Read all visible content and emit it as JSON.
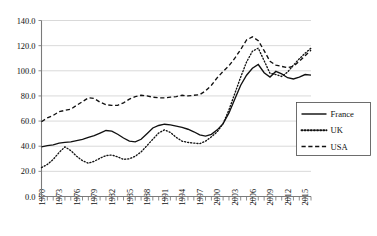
{
  "chart_data": {
    "type": "line",
    "title": "",
    "subtitle": "",
    "xlabel": "",
    "ylabel": "",
    "ylim": [
      0.0,
      140.0
    ],
    "xlim": [
      1970,
      2016
    ],
    "yticks": [
      "0.0",
      "20.0",
      "40.0",
      "60.0",
      "80.0",
      "100.0",
      "120.0",
      "140.0"
    ],
    "ytick_values": [
      0.0,
      20.0,
      40.0,
      60.0,
      80.0,
      100.0,
      120.0,
      140.0
    ],
    "xticks": [
      "1970",
      "1973",
      "1976",
      "1979",
      "1982",
      "1985",
      "1988",
      "1991",
      "1994",
      "1997",
      "2000",
      "2003",
      "2006",
      "2009",
      "2012",
      "2015"
    ],
    "xtick_values": [
      1970,
      1973,
      1976,
      1979,
      1982,
      1985,
      1988,
      1991,
      1994,
      1997,
      2000,
      2003,
      2006,
      2009,
      2012,
      2015
    ],
    "minor_xticks_every": 1,
    "grid": "horizontal",
    "legend_position": "right",
    "x": [
      1970,
      1971,
      1972,
      1973,
      1974,
      1975,
      1976,
      1977,
      1978,
      1979,
      1980,
      1981,
      1982,
      1983,
      1984,
      1985,
      1986,
      1987,
      1988,
      1989,
      1990,
      1991,
      1992,
      1993,
      1994,
      1995,
      1996,
      1997,
      1998,
      1999,
      2000,
      2001,
      2002,
      2003,
      2004,
      2005,
      2006,
      2007,
      2008,
      2009,
      2010,
      2011,
      2012,
      2013,
      2014,
      2015,
      2016
    ],
    "series": [
      {
        "name": "France",
        "style": "solid",
        "color": "#111111",
        "values": [
          39.5,
          40.5,
          41.0,
          42.5,
          43.0,
          43.5,
          44.5,
          45.5,
          47.0,
          48.5,
          50.5,
          52.5,
          52.0,
          49.5,
          46.5,
          44.0,
          43.5,
          45.5,
          50.0,
          54.5,
          56.5,
          57.5,
          57.0,
          56.0,
          55.0,
          53.5,
          51.5,
          49.0,
          48.0,
          49.5,
          53.0,
          58.0,
          66.5,
          77.5,
          88.5,
          96.5,
          102.0,
          105.0,
          98.5,
          95.0,
          99.5,
          97.5,
          94.5,
          93.5,
          95.0,
          97.0,
          96.5
        ]
      },
      {
        "name": "UK",
        "style": "dotted",
        "color": "#111111",
        "values": [
          23.0,
          25.5,
          29.5,
          35.0,
          39.5,
          36.5,
          32.0,
          28.5,
          26.5,
          28.0,
          30.5,
          32.5,
          33.0,
          31.5,
          29.5,
          30.0,
          32.0,
          35.5,
          40.5,
          45.5,
          50.5,
          53.0,
          51.0,
          47.0,
          44.0,
          43.0,
          42.5,
          42.0,
          44.0,
          47.5,
          51.5,
          58.0,
          69.0,
          82.0,
          95.0,
          107.0,
          115.5,
          118.0,
          108.0,
          98.0,
          97.0,
          95.5,
          99.0,
          104.5,
          109.5,
          114.0,
          118.0
        ]
      },
      {
        "name": "USA",
        "style": "dashed",
        "color": "#111111",
        "values": [
          59.5,
          62.5,
          64.5,
          67.5,
          68.5,
          69.5,
          72.5,
          75.5,
          78.5,
          78.0,
          75.0,
          73.0,
          72.5,
          72.5,
          74.5,
          77.5,
          79.5,
          80.5,
          80.0,
          79.0,
          78.5,
          78.5,
          79.0,
          79.5,
          80.5,
          80.0,
          80.5,
          81.0,
          84.0,
          88.5,
          94.5,
          99.5,
          104.0,
          110.0,
          117.0,
          124.5,
          127.0,
          124.0,
          116.0,
          107.5,
          104.5,
          103.5,
          102.5,
          103.5,
          107.5,
          112.0,
          116.5
        ]
      }
    ],
    "legend": [
      {
        "label": "France",
        "style": "solid"
      },
      {
        "label": "UK",
        "style": "dotted"
      },
      {
        "label": "USA",
        "style": "dashed"
      }
    ]
  }
}
